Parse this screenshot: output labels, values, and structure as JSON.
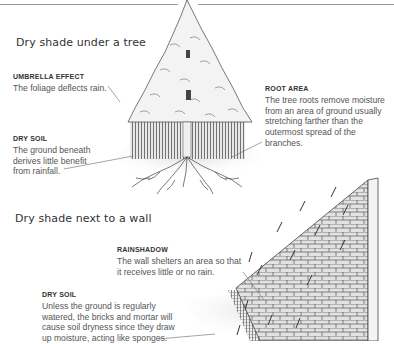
{
  "sections": [
    {
      "title": "Dry shade under a tree",
      "callouts": [
        {
          "heading": "Umbrella Effect",
          "text": "The foliage deflects rain."
        },
        {
          "heading": "Dry Soil",
          "text": "The ground beneath derives little benefit from rainfall."
        },
        {
          "heading": "Root Area",
          "text": "The tree roots remove moisture from an area of ground usually stretching farther than the outermost spread of the branches."
        }
      ],
      "illustration": "conifer-tree-with-shaded-soil-and-roots"
    },
    {
      "title": "Dry shade next to a wall",
      "callouts": [
        {
          "heading": "Rainshadow",
          "text": "The wall shelters an area so that it receives little or no rain."
        },
        {
          "heading": "Dry Soil",
          "text": "Unless the ground is regularly watered, the bricks and mortar will cause soil dryness since they draw up moisture, acting like sponges."
        }
      ],
      "illustration": "brick-wall-with-rain-and-rainshadow"
    }
  ],
  "colors": {
    "text": "#555555",
    "heading": "#333333",
    "rule": "#9a9a9a",
    "line": "#666666"
  }
}
